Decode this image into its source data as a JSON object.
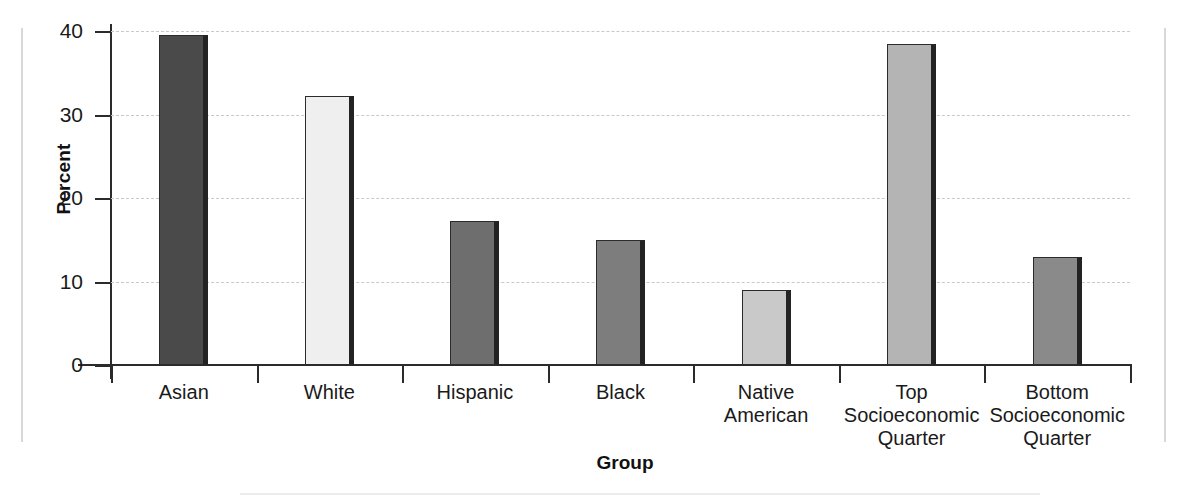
{
  "figure": {
    "background_color": "#ffffff",
    "frame_color": "#d8d8d8",
    "axis_color": "#2b2b2b",
    "gridline_color": "#c9c9c9"
  },
  "chart_data": {
    "type": "bar",
    "title": "",
    "subtitle": "",
    "xlabel": "Group",
    "ylabel": "Percent",
    "categories": [
      "Asian",
      "White",
      "Hispanic",
      "Black",
      "Native American",
      "Top Socioeconomic Quarter",
      "Bottom Socioeconomic Quarter"
    ],
    "category_lines": [
      [
        "Asian"
      ],
      [
        "White"
      ],
      [
        "Hispanic"
      ],
      [
        "Black"
      ],
      [
        "Native American"
      ],
      [
        "Top",
        "Socioeconomic",
        "Quarter"
      ],
      [
        "Bottom",
        "Socioeconomic",
        "Quarter"
      ]
    ],
    "values": [
      39.5,
      32.2,
      17.3,
      15.0,
      9.0,
      38.5,
      12.9
    ],
    "bar_colors": [
      "#4a4a4a",
      "#efefef",
      "#6e6e6e",
      "#7d7d7d",
      "#c9c9c9",
      "#b4b4b4",
      "#8a8a8a"
    ],
    "ylim": [
      0,
      40
    ],
    "yticks": [
      0,
      10,
      20,
      30,
      40
    ],
    "ytick_labels": [
      "0",
      "10",
      "20",
      "30",
      "40"
    ],
    "grid": true,
    "grid_axis": "y",
    "grid_style": "dashed",
    "legend": false,
    "legend_position": "none",
    "units": "percent"
  }
}
